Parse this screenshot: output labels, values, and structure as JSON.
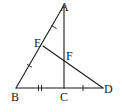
{
  "diagram": {
    "type": "geometry",
    "stroke_color": "#1a1a1a",
    "background": "#ffffff",
    "points": {
      "A": {
        "label": "A",
        "x": 64,
        "y": 5
      },
      "B": {
        "label": "B",
        "x": 16,
        "y": 88
      },
      "C": {
        "label": "C",
        "x": 64,
        "y": 88
      },
      "D": {
        "label": "D",
        "x": 103,
        "y": 88
      },
      "E": {
        "label": "E",
        "x": 43,
        "y": 46
      },
      "F": {
        "label": "F",
        "x": 64,
        "y": 60
      }
    },
    "segments": [
      {
        "name": "AB",
        "from": "A",
        "to": "B"
      },
      {
        "name": "AC",
        "from": "A",
        "to": "C"
      },
      {
        "name": "BD",
        "from": "B",
        "to": "D"
      },
      {
        "name": "ED",
        "from": "E",
        "to": "D"
      }
    ],
    "equal_marks": [
      {
        "segment": "AE",
        "ticks": 1
      },
      {
        "segment": "EB",
        "ticks": 1
      },
      {
        "segment": "BC",
        "ticks": 2
      },
      {
        "segment": "CD",
        "ticks": 1
      }
    ],
    "labels": {
      "A": "A",
      "B": "B",
      "C": "C",
      "D": "D",
      "E": "E",
      "F": "F"
    }
  }
}
